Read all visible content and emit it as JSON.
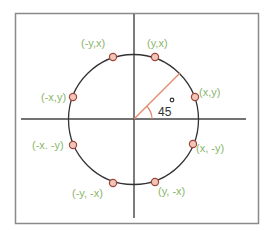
{
  "diagram": {
    "type": "circle-symmetry",
    "title": "",
    "angle_label": "45",
    "angle_degree_symbol": "°",
    "colors": {
      "frame": "#8a8a8a",
      "axes": "#444444",
      "circle": "#333333",
      "radius_line": "#e0876a",
      "point_fill": "#f1c6b8",
      "point_stroke": "#a0443a",
      "label": "#8ab56a",
      "angle_text": "#333333"
    },
    "points": [
      {
        "id": "y-x",
        "label": "(y,x)",
        "x": 155,
        "y": 57,
        "lx": 147,
        "ly": 47
      },
      {
        "id": "neg-y-x",
        "label": "(-y,x)",
        "x": 113,
        "y": 57,
        "lx": 81,
        "ly": 47
      },
      {
        "id": "x-y",
        "label": "(x,y)",
        "x": 195,
        "y": 97,
        "lx": 199,
        "ly": 96
      },
      {
        "id": "neg-x-y",
        "label": "(-x,y)",
        "x": 73,
        "y": 97,
        "lx": 41,
        "ly": 101
      },
      {
        "id": "neg-x-neg-y",
        "label": "(-x. -y)",
        "x": 73,
        "y": 145,
        "lx": 32,
        "ly": 149
      },
      {
        "id": "x-neg-y",
        "label": "(x, -y)",
        "x": 193,
        "y": 144,
        "lx": 196,
        "ly": 152
      },
      {
        "id": "neg-y-neg-x",
        "label": "(-y, -x)",
        "x": 113,
        "y": 183,
        "lx": 72,
        "ly": 197
      },
      {
        "id": "y-neg-x",
        "label": "(y, -x)",
        "x": 155,
        "y": 182,
        "lx": 158,
        "ly": 195
      }
    ]
  }
}
